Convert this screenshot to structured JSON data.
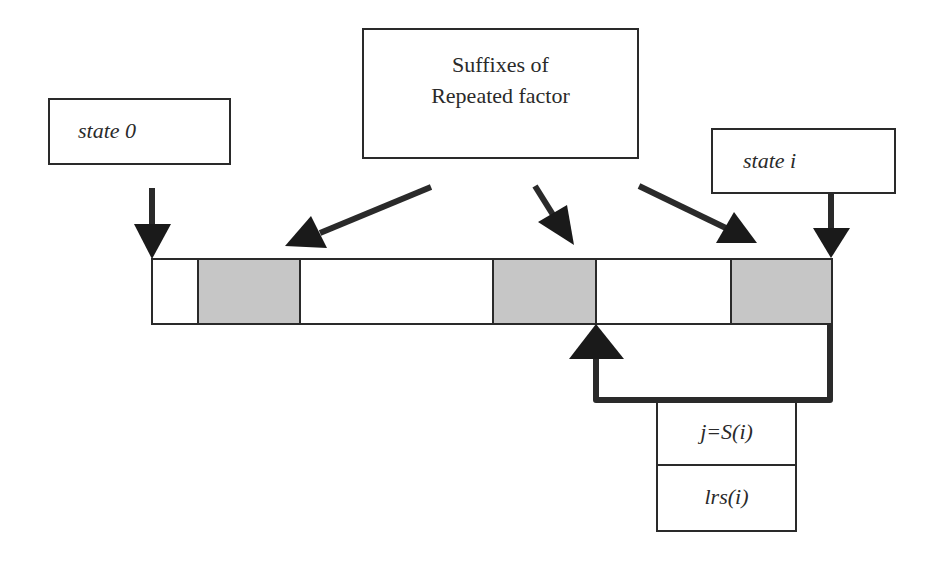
{
  "diagram": {
    "boxes": {
      "state0": {
        "label": "state 0"
      },
      "suffixes": {
        "line1": "Suffixes of",
        "line2": "Repeated factor"
      },
      "statei": {
        "label": "state i"
      },
      "link_table": {
        "row1": "j=S(i)",
        "row2": "lrs(i)"
      }
    },
    "bar": {
      "cells": [
        {
          "shaded": false
        },
        {
          "shaded": true
        },
        {
          "shaded": false
        },
        {
          "shaded": true
        },
        {
          "shaded": false
        },
        {
          "shaded": true
        }
      ]
    },
    "colors": {
      "stroke": "#2a2a2a",
      "shade": "#c6c6c6",
      "background": "#ffffff"
    }
  }
}
